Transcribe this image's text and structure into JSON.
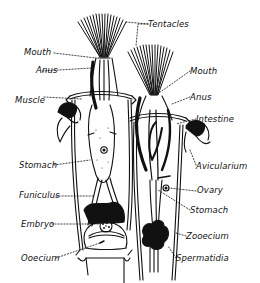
{
  "diagram": {
    "colors": {
      "ink": "#111111",
      "background": "#ffffff"
    },
    "labels": {
      "tentacles": "Tentacles",
      "mouth_left": "Mouth",
      "anus_left": "Anus",
      "muscle": "Muscle",
      "stomach_left": "Stomach",
      "funiculus": "Funiculus",
      "embryo": "Embryo",
      "ooecium": "Ooecium",
      "mouth_right": "Mouth",
      "anus_right": "Anus",
      "intestine": "Intestine",
      "avicularium": "Avicularium",
      "ovary": "Ovary",
      "stomach_right": "Stomach",
      "zooecium": "Zooecium",
      "spermatidia": "Spermatidia"
    }
  }
}
